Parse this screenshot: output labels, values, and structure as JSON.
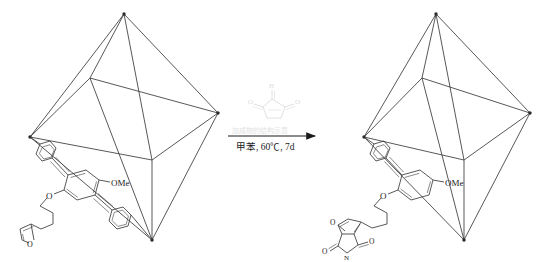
{
  "figure": {
    "type": "reaction-scheme",
    "background": "#ffffff",
    "bond_color": "#3a3a3a",
    "faint_color": "#d8d8d8",
    "text_color": "#222222"
  },
  "reactant": {
    "name": "furan-functionalised octahedral cage",
    "cage": {
      "shape": "octahedron",
      "vertices": 6,
      "edges": 12,
      "color": "#3a3a3a"
    },
    "ligand": {
      "labels": {
        "methoxy": "OMe",
        "ether_oxygen": "O",
        "furan_oxygen": "O"
      }
    }
  },
  "reagent": {
    "name": "maleimide",
    "labels": {
      "nitrogen": "N",
      "carbonyl_left": "O",
      "carbonyl_right": "O",
      "nh": "H"
    },
    "color": "#d9d9d9"
  },
  "arrow": {
    "above_label": "加成物的结构示意",
    "below_label": "甲苯, 60℃, 7d",
    "above_color": "#e2e2e2",
    "below_color": "#1a1a1a"
  },
  "product": {
    "name": "Diels-Alder adduct cage",
    "cage": {
      "shape": "octahedron",
      "vertices": 6,
      "edges": 12,
      "color": "#3a3a3a"
    },
    "ligand": {
      "labels": {
        "methoxy": "OMe",
        "ether_oxygen": "O",
        "bridge_oxygen": "O",
        "imide_nitrogen": "N",
        "carbonyl_a": "O",
        "carbonyl_b": "O"
      }
    }
  }
}
